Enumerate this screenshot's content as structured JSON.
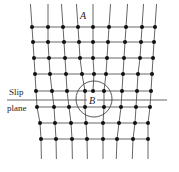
{
  "figure": {
    "type": "edge-dislocation-lattice",
    "labels": {
      "a": "A",
      "b": "B",
      "slip_line1": "Slip",
      "slip_line2": "plane"
    },
    "colors": {
      "line": "#555555",
      "atom": "#111111",
      "text": "#222222"
    },
    "rows_y": [
      27,
      42,
      58,
      74,
      91,
      107,
      123,
      139
    ],
    "line_top_y": 4,
    "line_bottom_y": 159,
    "columns": [
      {
        "x": [
          32,
          33,
          34,
          35,
          36,
          37,
          40,
          41
        ]
      },
      {
        "x": [
          48,
          48,
          49,
          50,
          52,
          54,
          55,
          56
        ]
      },
      {
        "x": [
          63,
          64,
          65,
          66,
          67,
          69,
          71,
          72
        ]
      },
      {
        "x": [
          78,
          79,
          80,
          82,
          85,
          85,
          86,
          87
        ]
      },
      {
        "x": [
          93,
          93,
          93,
          94,
          93,
          null,
          null,
          null
        ],
        "half_plane": true
      },
      {
        "x": [
          109,
          108,
          107,
          106,
          104,
          104,
          103,
          103
        ]
      },
      {
        "x": [
          126,
          125,
          124,
          123,
          122,
          121,
          119,
          117
        ]
      },
      {
        "x": [
          142,
          141,
          140,
          138,
          137,
          136,
          135,
          133
        ]
      },
      {
        "x": [
          155,
          154,
          153,
          152,
          151,
          150,
          148,
          148
        ]
      }
    ],
    "slip_plane": {
      "y": 100,
      "x1": 7,
      "x2": 167
    },
    "circle_b": {
      "cx": 94,
      "cy": 99,
      "r": 18
    },
    "label_positions": {
      "a": {
        "x": 80,
        "y": 19
      },
      "b": {
        "x": 89,
        "y": 104
      },
      "slip": {
        "x": 9,
        "y": 95
      },
      "plane": {
        "x": 7,
        "y": 111
      }
    }
  }
}
